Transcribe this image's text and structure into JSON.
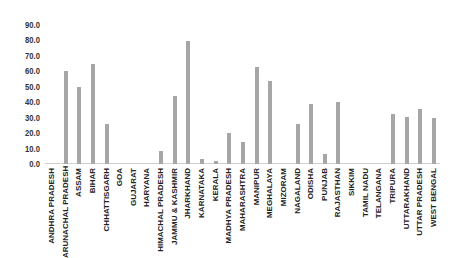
{
  "chart_data": {
    "type": "bar",
    "title": "",
    "xlabel": "",
    "ylabel": "",
    "ylim": [
      0,
      90
    ],
    "yticks": [
      "0.0",
      "10.0",
      "20.0",
      "30.0",
      "40.0",
      "50.0",
      "60.0",
      "70.0",
      "80.0",
      "90.0"
    ],
    "grid": false,
    "legend": null,
    "bar_color": "#a6a6a6",
    "categories": [
      "ANDHRA PRADESH",
      "ARUNACHAL PRADESH",
      "ASSAM",
      "BIHAR",
      "CHHATTISGARH",
      "GOA",
      "GUJARAT",
      "HARYANA",
      "HIMACHAL PRADESH",
      "JAMMU & KASHMIR",
      "JHARKHAND",
      "KARNATAKA",
      "KERALA",
      "MADHYA PRADESH",
      "MAHARASHTRA",
      "MANIPUR",
      "MEGHALAYA",
      "MIZORAM",
      "NAGALAND",
      "ODISHA",
      "PUNJAB",
      "RAJASTHAN",
      "SIKKIM",
      "TAMIL NADU",
      "TELANGANA",
      "TRIPURA",
      "UTTARAKHAND",
      "UTTAR PRADESH",
      "WEST BENGAL"
    ],
    "values": [
      0,
      60.4,
      50.0,
      64.5,
      25.7,
      0,
      0,
      0,
      8.4,
      43.8,
      79.4,
      3.2,
      2.0,
      19.9,
      14.4,
      62.6,
      53.5,
      0,
      26.1,
      38.8,
      6.3,
      40.1,
      0,
      0,
      0,
      32.2,
      30.4,
      35.4,
      29.8
    ]
  }
}
